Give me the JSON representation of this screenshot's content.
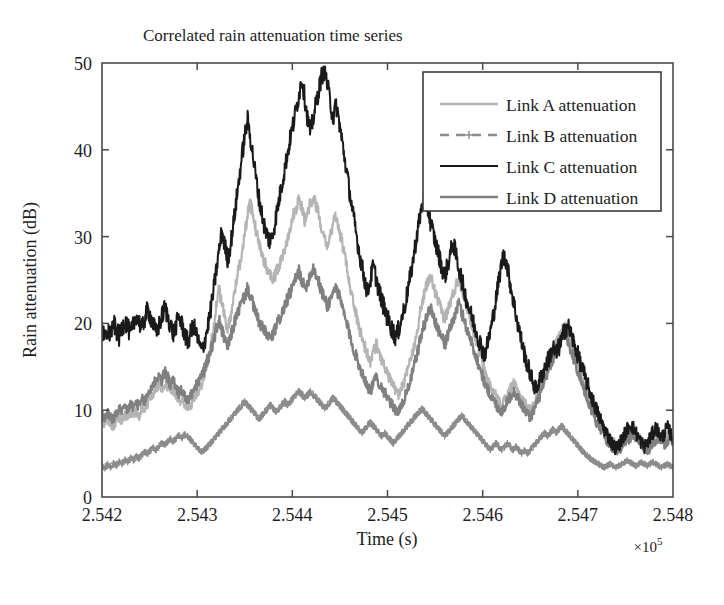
{
  "figure": {
    "title": "Correlated rain attenuation time series",
    "background": "#ffffff"
  },
  "axes": {
    "x": {
      "label": "Time (s)",
      "multiplier_prefix": "×10",
      "multiplier_exponent": "5",
      "ticks": [
        "2.542",
        "2.543",
        "2.544",
        "2.545",
        "2.546",
        "2.547",
        "2.548"
      ],
      "min": 2.542,
      "max": 2.548
    },
    "y": {
      "label": "Rain attenuation (dB)",
      "ticks": [
        "0",
        "10",
        "20",
        "30",
        "40",
        "50"
      ],
      "min": 0,
      "max": 50
    }
  },
  "legend": {
    "entries": [
      {
        "label": "Link A attenuation",
        "color": "#b4b4b4",
        "style": "solid",
        "marker": "none"
      },
      {
        "label": "Link B attenuation",
        "color": "#8c8c8c",
        "style": "dashed",
        "marker": "plus"
      },
      {
        "label": "Link C attenuation",
        "color": "#1a1a1a",
        "style": "solid",
        "marker": "none"
      },
      {
        "label": "Link D attenuation",
        "color": "#808080",
        "style": "solid",
        "marker": "none"
      }
    ]
  },
  "chart_data": {
    "type": "line",
    "title": "Correlated rain attenuation time series",
    "xlabel": "Time (s)",
    "ylabel": "Rain attenuation (dB)",
    "xlim": [
      2.542,
      2.548
    ],
    "ylim": [
      0,
      50
    ],
    "x_multiplier": "×10^5",
    "grid": false,
    "legend_position": "upper right",
    "x_tick_labels": [
      "2.542",
      "2.543",
      "2.544",
      "2.545",
      "2.546",
      "2.547",
      "2.548"
    ],
    "y_tick_labels": [
      "0",
      "10",
      "20",
      "30",
      "40",
      "50"
    ],
    "x": [
      2.542,
      2.54203,
      2.54206,
      2.54209,
      2.54212,
      2.54215,
      2.54218,
      2.54221,
      2.54224,
      2.54227,
      2.5423,
      2.54233,
      2.54236,
      2.54239,
      2.54242,
      2.54245,
      2.54248,
      2.54251,
      2.54254,
      2.54257,
      2.5426,
      2.54263,
      2.54266,
      2.54269,
      2.54272,
      2.54275,
      2.54278,
      2.54281,
      2.54284,
      2.54287,
      2.5429,
      2.54293,
      2.54296,
      2.54299,
      2.54302,
      2.54305,
      2.54308,
      2.54311,
      2.54314,
      2.54317,
      2.5432,
      2.54323,
      2.54326,
      2.54329,
      2.54332,
      2.54335,
      2.54338,
      2.54341,
      2.54344,
      2.54347,
      2.5435,
      2.54353,
      2.54356,
      2.54359,
      2.54362,
      2.54365,
      2.54368,
      2.54371,
      2.54374,
      2.54377,
      2.5438,
      2.54383,
      2.54386,
      2.54389,
      2.54392,
      2.54395,
      2.54398,
      2.54401,
      2.54404,
      2.54407,
      2.5441,
      2.54413,
      2.54416,
      2.54419,
      2.54422,
      2.54425,
      2.54428,
      2.54431,
      2.54434,
      2.54437,
      2.5444,
      2.54443,
      2.54446,
      2.54449,
      2.54452,
      2.54455,
      2.54458,
      2.54461,
      2.54464,
      2.54467,
      2.5447,
      2.54473,
      2.54476,
      2.54479,
      2.54482,
      2.54485,
      2.54488,
      2.54491,
      2.54494,
      2.54497,
      2.545,
      2.54503,
      2.54506,
      2.54509,
      2.54512,
      2.54515,
      2.54518,
      2.54521,
      2.54524,
      2.54527,
      2.5453,
      2.54533,
      2.54536,
      2.54539,
      2.54542,
      2.54545,
      2.54548,
      2.54551,
      2.54554,
      2.54557,
      2.5456,
      2.54563,
      2.54566,
      2.54569,
      2.54572,
      2.54575,
      2.54578,
      2.54581,
      2.54584,
      2.54587,
      2.5459,
      2.54593,
      2.54596,
      2.54599,
      2.54602,
      2.54605,
      2.54608,
      2.54611,
      2.54614,
      2.54617,
      2.5462,
      2.54623,
      2.54626,
      2.54629,
      2.54632,
      2.54635,
      2.54638,
      2.54641,
      2.54644,
      2.54647,
      2.5465,
      2.54653,
      2.54656,
      2.54659,
      2.54662,
      2.54665,
      2.54668,
      2.54671,
      2.54674,
      2.54677,
      2.5468,
      2.54683,
      2.54686,
      2.54689,
      2.54692,
      2.54695,
      2.54698,
      2.54701,
      2.54704,
      2.54707,
      2.5471,
      2.54713,
      2.54716,
      2.54719,
      2.54722,
      2.54725,
      2.54728,
      2.54731,
      2.54734,
      2.54737,
      2.5474,
      2.54743,
      2.54746,
      2.54749,
      2.54752,
      2.54755,
      2.54758,
      2.54761,
      2.54764,
      2.54767,
      2.5477,
      2.54773,
      2.54776,
      2.54779,
      2.54782,
      2.54785,
      2.54788,
      2.54791,
      2.54794,
      2.54797,
      2.548
    ],
    "series": [
      {
        "name": "Link A attenuation",
        "color": "#b4b4b4",
        "style": "solid",
        "width": 2.2,
        "values": [
          8.6,
          8.2,
          9.0,
          8.4,
          7.9,
          8.8,
          9.3,
          8.7,
          9.5,
          9.1,
          9.8,
          9.2,
          10.0,
          9.4,
          10.4,
          10.1,
          10.8,
          11.4,
          12.0,
          12.6,
          13.0,
          12.4,
          13.3,
          12.8,
          11.9,
          12.3,
          11.6,
          10.9,
          11.4,
          10.6,
          10.1,
          10.6,
          11.2,
          11.8,
          12.4,
          13.2,
          14.3,
          15.6,
          17.2,
          19.4,
          21.8,
          24.0,
          22.3,
          20.6,
          19.4,
          20.8,
          22.6,
          24.8,
          26.4,
          28.2,
          30.4,
          32.6,
          33.8,
          32.2,
          30.6,
          29.2,
          28.0,
          27.0,
          26.2,
          25.6,
          25.0,
          25.8,
          26.6,
          27.4,
          28.6,
          29.8,
          31.2,
          32.6,
          33.4,
          34.4,
          33.2,
          31.8,
          32.8,
          33.8,
          34.6,
          33.6,
          32.4,
          31.0,
          30.0,
          29.0,
          30.2,
          31.4,
          32.4,
          31.0,
          29.4,
          27.8,
          26.0,
          24.2,
          22.6,
          21.0,
          19.6,
          18.4,
          17.4,
          16.4,
          15.6,
          16.6,
          17.6,
          16.8,
          15.8,
          15.0,
          14.2,
          13.4,
          12.8,
          12.2,
          11.8,
          12.6,
          13.4,
          14.4,
          15.6,
          17.0,
          18.6,
          20.4,
          22.2,
          23.6,
          24.6,
          25.4,
          24.4,
          23.2,
          22.2,
          21.4,
          20.6,
          21.4,
          22.4,
          23.4,
          24.4,
          25.2,
          24.2,
          23.0,
          21.8,
          20.6,
          19.4,
          18.2,
          17.0,
          15.8,
          14.6,
          13.6,
          12.8,
          12.2,
          11.6,
          11.0,
          10.6,
          11.2,
          11.8,
          12.4,
          13.0,
          12.6,
          12.0,
          11.4,
          10.8,
          10.4,
          10.0,
          10.6,
          11.4,
          12.2,
          13.0,
          14.0,
          15.0,
          16.0,
          16.8,
          17.6,
          18.4,
          19.2,
          19.8,
          19.0,
          18.0,
          17.0,
          16.0,
          15.0,
          14.0,
          13.0,
          12.0,
          11.2,
          10.4,
          9.6,
          9.0,
          8.4,
          7.8,
          7.2,
          6.8,
          6.4,
          6.0,
          5.8,
          6.2,
          6.6,
          7.0,
          7.4,
          7.8,
          7.4,
          7.0,
          6.6,
          6.2,
          5.8,
          6.2,
          6.6,
          7.0,
          7.4,
          7.0,
          6.6,
          7.0,
          7.4,
          7.0
        ]
      },
      {
        "name": "Link B attenuation",
        "color": "#8c8c8c",
        "style": "dashed",
        "marker": "plus",
        "width": 2.2,
        "values": [
          3.6,
          3.3,
          3.8,
          3.4,
          3.9,
          3.6,
          4.1,
          3.8,
          4.3,
          4.0,
          4.5,
          4.2,
          4.7,
          4.4,
          4.9,
          5.2,
          5.0,
          5.4,
          5.7,
          5.4,
          5.9,
          6.2,
          6.0,
          6.4,
          6.7,
          6.4,
          6.8,
          7.1,
          6.8,
          7.2,
          7.0,
          6.6,
          6.2,
          5.8,
          5.5,
          5.2,
          5.5,
          5.8,
          6.2,
          6.6,
          7.0,
          7.4,
          7.8,
          8.2,
          8.6,
          9.0,
          9.4,
          9.8,
          10.2,
          10.6,
          11.0,
          10.6,
          10.2,
          9.8,
          9.4,
          9.0,
          9.4,
          9.8,
          10.2,
          10.6,
          10.2,
          9.8,
          10.2,
          10.6,
          11.0,
          10.6,
          11.0,
          11.4,
          11.8,
          12.2,
          11.8,
          11.4,
          11.8,
          12.2,
          11.8,
          11.4,
          11.0,
          10.6,
          10.2,
          10.6,
          11.0,
          11.4,
          11.0,
          10.6,
          10.2,
          9.8,
          9.4,
          9.0,
          8.6,
          8.2,
          7.8,
          7.4,
          7.8,
          8.2,
          8.6,
          8.2,
          7.8,
          7.4,
          7.0,
          7.4,
          7.0,
          6.6,
          6.2,
          6.6,
          7.0,
          7.4,
          7.8,
          8.2,
          8.6,
          9.0,
          9.4,
          9.8,
          10.2,
          9.8,
          9.4,
          9.0,
          8.6,
          8.2,
          7.8,
          7.4,
          7.0,
          7.4,
          7.8,
          8.2,
          8.6,
          9.0,
          9.4,
          9.0,
          8.6,
          8.2,
          7.8,
          7.4,
          7.0,
          6.6,
          6.2,
          5.8,
          5.4,
          5.8,
          6.2,
          5.8,
          5.4,
          5.8,
          6.2,
          5.8,
          5.4,
          5.8,
          5.4,
          5.0,
          5.4,
          5.0,
          5.4,
          5.8,
          6.2,
          6.6,
          7.0,
          7.4,
          7.0,
          7.4,
          7.8,
          7.4,
          7.8,
          8.2,
          7.8,
          7.4,
          7.0,
          6.6,
          6.2,
          5.8,
          5.4,
          5.0,
          4.8,
          4.4,
          4.2,
          4.0,
          3.8,
          3.6,
          3.4,
          3.6,
          3.8,
          3.6,
          3.4,
          3.6,
          3.8,
          4.0,
          4.2,
          4.0,
          3.8,
          3.6,
          3.8,
          4.0,
          3.8,
          3.6,
          3.8,
          4.0,
          3.8,
          3.6,
          3.4,
          3.6,
          3.8,
          3.6,
          3.5
        ]
      },
      {
        "name": "Link C attenuation",
        "color": "#1a1a1a",
        "style": "solid",
        "width": 2.0,
        "values": [
          19.2,
          18.4,
          19.6,
          18.8,
          20.0,
          19.2,
          18.4,
          19.4,
          20.4,
          19.6,
          18.6,
          19.8,
          21.0,
          20.2,
          19.4,
          20.6,
          21.6,
          20.8,
          19.8,
          18.8,
          19.8,
          20.8,
          21.8,
          20.8,
          19.8,
          18.8,
          19.8,
          20.8,
          19.8,
          18.8,
          17.8,
          18.8,
          19.8,
          18.8,
          17.6,
          16.8,
          18.0,
          19.6,
          21.4,
          23.6,
          26.0,
          28.4,
          30.6,
          29.0,
          27.4,
          29.0,
          31.4,
          34.0,
          36.6,
          39.2,
          41.6,
          43.4,
          41.4,
          39.0,
          36.6,
          34.4,
          32.6,
          31.0,
          30.0,
          29.4,
          30.6,
          32.4,
          34.2,
          36.0,
          37.8,
          39.6,
          41.4,
          43.0,
          44.6,
          46.4,
          48.2,
          46.0,
          43.6,
          42.0,
          43.6,
          45.4,
          47.0,
          48.6,
          49.2,
          47.4,
          45.4,
          43.6,
          45.2,
          43.4,
          41.2,
          39.0,
          36.8,
          34.6,
          32.4,
          30.4,
          28.4,
          26.6,
          25.0,
          23.6,
          25.0,
          26.6,
          25.2,
          23.8,
          22.6,
          21.6,
          20.6,
          19.8,
          19.0,
          18.4,
          19.4,
          20.6,
          22.0,
          23.6,
          25.4,
          27.4,
          29.6,
          31.6,
          33.4,
          34.8,
          33.4,
          31.8,
          30.4,
          29.0,
          27.8,
          26.6,
          25.4,
          26.6,
          28.0,
          29.4,
          27.8,
          26.4,
          25.0,
          23.6,
          22.4,
          21.2,
          20.2,
          19.2,
          18.2,
          17.2,
          16.4,
          17.6,
          19.0,
          20.8,
          22.8,
          25.0,
          27.0,
          28.0,
          26.4,
          24.6,
          22.8,
          21.0,
          19.4,
          17.8,
          16.4,
          15.2,
          14.2,
          13.2,
          12.4,
          13.2,
          14.0,
          14.8,
          15.6,
          16.4,
          17.2,
          16.4,
          17.2,
          18.0,
          19.2,
          19.8,
          19.0,
          18.0,
          17.0,
          16.0,
          15.0,
          14.0,
          13.0,
          12.0,
          11.0,
          10.2,
          9.4,
          8.6,
          7.8,
          7.2,
          6.6,
          6.0,
          5.6,
          6.0,
          6.6,
          7.2,
          7.8,
          8.4,
          8.0,
          7.4,
          6.8,
          6.2,
          5.8,
          6.2,
          6.8,
          7.4,
          8.0,
          7.4,
          6.8,
          7.4,
          8.0,
          7.4,
          6.8
        ]
      },
      {
        "name": "Link D attenuation",
        "color": "#808080",
        "style": "solid",
        "width": 2.4,
        "values": [
          9.4,
          9.0,
          9.8,
          9.2,
          8.8,
          9.6,
          10.2,
          9.6,
          10.4,
          10.0,
          10.8,
          10.2,
          11.0,
          10.4,
          11.2,
          11.0,
          11.8,
          12.4,
          13.0,
          13.6,
          14.0,
          13.4,
          14.4,
          13.8,
          12.9,
          13.4,
          12.6,
          11.9,
          12.4,
          11.6,
          11.1,
          11.6,
          12.2,
          12.8,
          13.4,
          14.0,
          14.8,
          15.8,
          16.8,
          18.0,
          19.2,
          20.4,
          19.2,
          18.0,
          17.2,
          18.4,
          19.6,
          20.8,
          21.6,
          22.4,
          23.2,
          24.0,
          23.2,
          22.0,
          21.0,
          20.2,
          19.6,
          19.0,
          18.6,
          18.2,
          18.8,
          19.6,
          20.4,
          21.2,
          22.0,
          22.8,
          23.6,
          24.4,
          25.2,
          26.0,
          25.0,
          24.0,
          24.8,
          25.6,
          26.4,
          25.6,
          24.6,
          23.6,
          22.8,
          22.0,
          22.8,
          23.6,
          24.2,
          23.2,
          22.0,
          20.8,
          19.6,
          18.4,
          17.2,
          16.2,
          15.2,
          14.4,
          13.6,
          12.8,
          12.2,
          13.0,
          13.8,
          13.2,
          12.6,
          12.0,
          11.4,
          10.8,
          10.4,
          10.0,
          9.8,
          10.6,
          11.4,
          12.4,
          13.4,
          14.6,
          16.0,
          17.4,
          18.8,
          20.0,
          21.0,
          21.8,
          21.0,
          20.0,
          19.2,
          18.4,
          17.6,
          18.4,
          19.4,
          20.4,
          21.4,
          22.2,
          21.2,
          20.2,
          19.2,
          18.2,
          17.2,
          16.2,
          15.2,
          14.2,
          13.2,
          12.4,
          11.8,
          11.2,
          10.6,
          10.2,
          9.8,
          10.4,
          11.0,
          11.6,
          12.2,
          11.8,
          11.2,
          10.6,
          10.0,
          9.6,
          9.2,
          9.8,
          10.6,
          11.4,
          12.2,
          13.2,
          14.2,
          15.2,
          16.0,
          16.8,
          17.6,
          18.4,
          19.0,
          18.2,
          17.2,
          16.2,
          15.2,
          14.2,
          13.2,
          12.2,
          11.2,
          10.4,
          9.6,
          8.8,
          8.2,
          7.6,
          7.0,
          6.4,
          6.0,
          5.6,
          5.4,
          5.2,
          5.6,
          6.0,
          6.4,
          6.8,
          7.2,
          6.8,
          6.4,
          6.0,
          5.6,
          5.2,
          5.6,
          6.0,
          6.4,
          6.8,
          6.4,
          6.0,
          6.4,
          6.8,
          6.4
        ]
      }
    ]
  }
}
